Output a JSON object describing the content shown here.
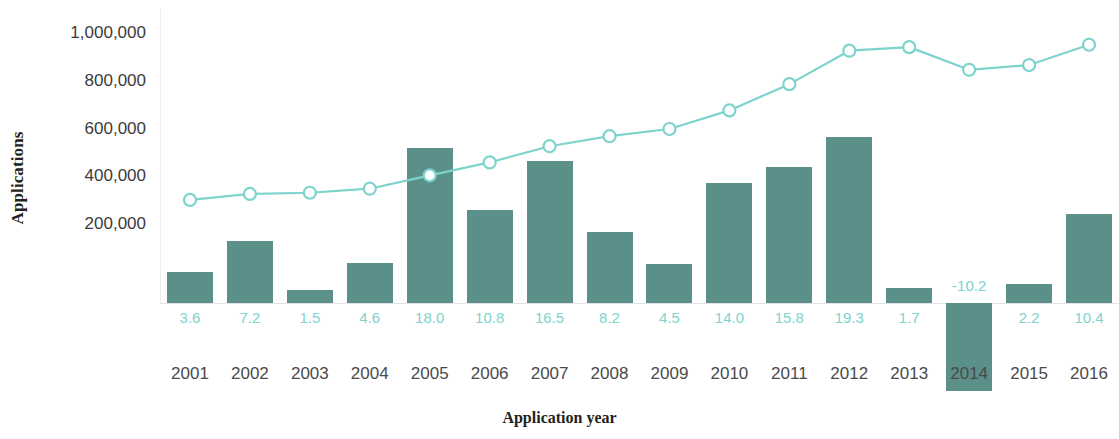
{
  "chart_data": {
    "type": "bar",
    "title": "",
    "xlabel": "Application year",
    "ylabel": "Applications",
    "categories": [
      "2001",
      "2002",
      "2003",
      "2004",
      "2005",
      "2006",
      "2007",
      "2008",
      "2009",
      "2010",
      "2011",
      "2012",
      "2013",
      "2014",
      "2015",
      "2016"
    ],
    "grid": false,
    "legend": "none",
    "ylim": [
      0,
      1100000
    ],
    "y_ticks": [
      "200,000",
      "400,000",
      "600,000",
      "800,000",
      "1,000,000"
    ],
    "y_tick_values": [
      200000,
      400000,
      600000,
      800000,
      1000000
    ],
    "series": [
      {
        "name": "Applications",
        "type": "line",
        "color": "#7ed3cc",
        "marker": "open-circle",
        "values": [
          305000,
          330000,
          335000,
          352000,
          408000,
          462000,
          530000,
          572000,
          602000,
          680000,
          790000,
          930000,
          945000,
          850000,
          870000,
          955000
        ]
      },
      {
        "name": "Growth rate",
        "type": "bar",
        "color": "#5b8f89",
        "labels": [
          "3.6",
          "7.2",
          "1.5",
          "4.6",
          "18.0",
          "10.8",
          "16.5",
          "8.2",
          "4.5",
          "14.0",
          "15.8",
          "19.3",
          "1.7",
          "-10.2",
          "2.2",
          "10.4"
        ],
        "values": [
          3.6,
          7.2,
          1.5,
          4.6,
          18.0,
          10.8,
          16.5,
          8.2,
          4.5,
          14.0,
          15.8,
          19.3,
          1.7,
          -10.2,
          2.2,
          10.4
        ]
      }
    ]
  },
  "colors": {
    "bar": "#5b8f89",
    "line": "#7ed3cc",
    "bar_label": "#7ed3cc",
    "axis_text": "#3b3b3b",
    "axis_line": "#e2e2e2"
  }
}
